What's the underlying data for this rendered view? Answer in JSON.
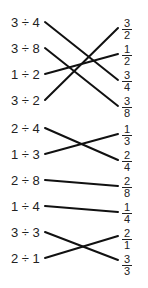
{
  "left_items": [
    {
      "label": "3 ÷ 4",
      "y": 16
    },
    {
      "label": "3 ÷ 8",
      "y": 42
    },
    {
      "label": "1 ÷ 2",
      "y": 68
    },
    {
      "label": "3 ÷ 2",
      "y": 94
    },
    {
      "label": "2 ÷ 4",
      "y": 122
    },
    {
      "label": "1 ÷ 3",
      "y": 148
    },
    {
      "label": "2 ÷ 8",
      "y": 174
    },
    {
      "label": "1 ÷ 4",
      "y": 200
    },
    {
      "label": "3 ÷ 3",
      "y": 226
    },
    {
      "label": "2 ÷ 1",
      "y": 252
    }
  ],
  "right_items": [
    {
      "num": "3",
      "den": "2",
      "y": 18
    },
    {
      "num": "1",
      "den": "2",
      "y": 44
    },
    {
      "num": "3",
      "den": "4",
      "y": 70
    },
    {
      "num": "3",
      "den": "8",
      "y": 96
    },
    {
      "num": "1",
      "den": "3",
      "y": 124
    },
    {
      "num": "2",
      "den": "4",
      "y": 150
    },
    {
      "num": "2",
      "den": "8",
      "y": 176
    },
    {
      "num": "1",
      "den": "4",
      "y": 202
    },
    {
      "num": "2",
      "den": "1",
      "y": 228
    },
    {
      "num": "3",
      "den": "3",
      "y": 254
    }
  ],
  "connections": [
    {
      "from": "3 ÷ 4",
      "to": "3/4",
      "x1": 45,
      "y1": 22,
      "x2": 118,
      "y2": 80
    },
    {
      "from": "3 ÷ 8",
      "to": "3/8",
      "x1": 45,
      "y1": 48,
      "x2": 118,
      "y2": 106
    },
    {
      "from": "1 ÷ 2",
      "to": "1/2",
      "x1": 45,
      "y1": 74,
      "x2": 118,
      "y2": 54
    },
    {
      "from": "3 ÷ 2",
      "to": "3/2",
      "x1": 45,
      "y1": 100,
      "x2": 118,
      "y2": 28
    },
    {
      "from": "2 ÷ 4",
      "to": "2/4",
      "x1": 45,
      "y1": 128,
      "x2": 118,
      "y2": 160
    },
    {
      "from": "1 ÷ 3",
      "to": "1/3",
      "x1": 45,
      "y1": 154,
      "x2": 118,
      "y2": 134
    },
    {
      "from": "2 ÷ 8",
      "to": "2/8",
      "x1": 45,
      "y1": 180,
      "x2": 118,
      "y2": 186
    },
    {
      "from": "1 ÷ 4",
      "to": "1/4",
      "x1": 45,
      "y1": 206,
      "x2": 118,
      "y2": 212
    },
    {
      "from": "3 ÷ 3",
      "to": "3/3",
      "x1": 45,
      "y1": 232,
      "x2": 118,
      "y2": 260
    },
    {
      "from": "2 ÷ 1",
      "to": "2/1",
      "x1": 45,
      "y1": 258,
      "x2": 118,
      "y2": 236
    }
  ]
}
